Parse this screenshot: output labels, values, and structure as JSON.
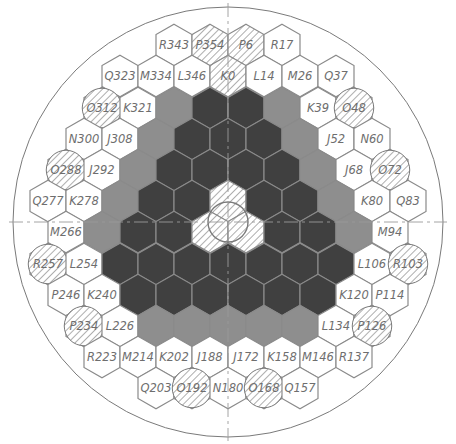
{
  "diagram": {
    "center": [
      228,
      222
    ],
    "outer_circle_radius": 215,
    "central_circle_radius": 20,
    "hex_width": 36,
    "row_spacing": 31.2,
    "colors": {
      "background": "#ffffff",
      "outline": "#8a8a8a",
      "dark": "#404040",
      "gray": "#8e8e8e",
      "light": "#ffffff",
      "hatch": "#9a9a9a",
      "circle_line": "#7a7a7a",
      "label": "#6e6e6e"
    },
    "legend_types": {
      "light": "labeled assembly",
      "hatched": "hatched hexagonal assembly",
      "circle": "hatched circular position",
      "dark": "dark shaded assembly",
      "gray": "gray shaded assembly"
    },
    "cells": [
      {
        "x": 174,
        "y": 45,
        "type": "light",
        "label": "R343"
      },
      {
        "x": 210,
        "y": 45,
        "type": "hatched",
        "label": "P354"
      },
      {
        "x": 246,
        "y": 45,
        "type": "hatched",
        "label": "P6"
      },
      {
        "x": 282,
        "y": 45,
        "type": "light",
        "label": "R17"
      },
      {
        "x": 120,
        "y": 76,
        "type": "light",
        "label": "Q323"
      },
      {
        "x": 156,
        "y": 76,
        "type": "light",
        "label": "M334"
      },
      {
        "x": 192,
        "y": 76,
        "type": "light",
        "label": "L346"
      },
      {
        "x": 228,
        "y": 76,
        "type": "hatched",
        "label": "K0"
      },
      {
        "x": 264,
        "y": 76,
        "type": "light",
        "label": "L14"
      },
      {
        "x": 300,
        "y": 76,
        "type": "light",
        "label": "M26"
      },
      {
        "x": 336,
        "y": 76,
        "type": "light",
        "label": "Q37"
      },
      {
        "x": 102,
        "y": 108,
        "type": "circle",
        "label": "O312"
      },
      {
        "x": 138,
        "y": 108,
        "type": "light",
        "label": "K321"
      },
      {
        "x": 174,
        "y": 108,
        "type": "gray",
        "label": ""
      },
      {
        "x": 210,
        "y": 108,
        "type": "dark",
        "label": ""
      },
      {
        "x": 246,
        "y": 108,
        "type": "dark",
        "label": ""
      },
      {
        "x": 282,
        "y": 108,
        "type": "gray",
        "label": ""
      },
      {
        "x": 318,
        "y": 108,
        "type": "light",
        "label": "K39"
      },
      {
        "x": 354,
        "y": 108,
        "type": "circle",
        "label": "O48"
      },
      {
        "x": 84,
        "y": 139,
        "type": "light",
        "label": "N300"
      },
      {
        "x": 120,
        "y": 139,
        "type": "light",
        "label": "J308"
      },
      {
        "x": 156,
        "y": 139,
        "type": "gray",
        "label": ""
      },
      {
        "x": 192,
        "y": 139,
        "type": "dark",
        "label": ""
      },
      {
        "x": 228,
        "y": 139,
        "type": "dark",
        "label": ""
      },
      {
        "x": 264,
        "y": 139,
        "type": "dark",
        "label": ""
      },
      {
        "x": 300,
        "y": 139,
        "type": "gray",
        "label": ""
      },
      {
        "x": 336,
        "y": 139,
        "type": "light",
        "label": "J52"
      },
      {
        "x": 372,
        "y": 139,
        "type": "light",
        "label": "N60"
      },
      {
        "x": 66,
        "y": 170,
        "type": "circle",
        "label": "O288"
      },
      {
        "x": 102,
        "y": 170,
        "type": "light",
        "label": "J292"
      },
      {
        "x": 138,
        "y": 170,
        "type": "gray",
        "label": ""
      },
      {
        "x": 174,
        "y": 170,
        "type": "dark",
        "label": ""
      },
      {
        "x": 210,
        "y": 170,
        "type": "dark",
        "label": ""
      },
      {
        "x": 246,
        "y": 170,
        "type": "dark",
        "label": ""
      },
      {
        "x": 282,
        "y": 170,
        "type": "dark",
        "label": ""
      },
      {
        "x": 318,
        "y": 170,
        "type": "gray",
        "label": ""
      },
      {
        "x": 354,
        "y": 170,
        "type": "light",
        "label": "J68"
      },
      {
        "x": 390,
        "y": 170,
        "type": "circle",
        "label": "O72"
      },
      {
        "x": 48,
        "y": 201,
        "type": "light",
        "label": "Q277"
      },
      {
        "x": 84,
        "y": 201,
        "type": "light",
        "label": "K278"
      },
      {
        "x": 120,
        "y": 201,
        "type": "gray",
        "label": ""
      },
      {
        "x": 156,
        "y": 201,
        "type": "dark",
        "label": ""
      },
      {
        "x": 192,
        "y": 201,
        "type": "dark",
        "label": ""
      },
      {
        "x": 228,
        "y": 201,
        "type": "hatched",
        "label": ""
      },
      {
        "x": 264,
        "y": 201,
        "type": "dark",
        "label": ""
      },
      {
        "x": 300,
        "y": 201,
        "type": "dark",
        "label": ""
      },
      {
        "x": 336,
        "y": 201,
        "type": "gray",
        "label": ""
      },
      {
        "x": 372,
        "y": 201,
        "type": "light",
        "label": "K80"
      },
      {
        "x": 408,
        "y": 201,
        "type": "light",
        "label": "Q83"
      },
      {
        "x": 66,
        "y": 232,
        "type": "light",
        "label": "M266"
      },
      {
        "x": 102,
        "y": 232,
        "type": "gray",
        "label": ""
      },
      {
        "x": 138,
        "y": 232,
        "type": "dark",
        "label": ""
      },
      {
        "x": 174,
        "y": 232,
        "type": "dark",
        "label": ""
      },
      {
        "x": 210,
        "y": 232,
        "type": "hatched",
        "label": ""
      },
      {
        "x": 246,
        "y": 232,
        "type": "hatched",
        "label": ""
      },
      {
        "x": 282,
        "y": 232,
        "type": "dark",
        "label": ""
      },
      {
        "x": 318,
        "y": 232,
        "type": "dark",
        "label": ""
      },
      {
        "x": 354,
        "y": 232,
        "type": "gray",
        "label": ""
      },
      {
        "x": 390,
        "y": 232,
        "type": "light",
        "label": "M94"
      },
      {
        "x": 48,
        "y": 264,
        "type": "circle",
        "label": "R257"
      },
      {
        "x": 84,
        "y": 264,
        "type": "light",
        "label": "L254"
      },
      {
        "x": 120,
        "y": 264,
        "type": "dark",
        "label": ""
      },
      {
        "x": 156,
        "y": 264,
        "type": "dark",
        "label": ""
      },
      {
        "x": 192,
        "y": 264,
        "type": "dark",
        "label": ""
      },
      {
        "x": 228,
        "y": 264,
        "type": "dark",
        "label": ""
      },
      {
        "x": 264,
        "y": 264,
        "type": "dark",
        "label": ""
      },
      {
        "x": 300,
        "y": 264,
        "type": "dark",
        "label": ""
      },
      {
        "x": 336,
        "y": 264,
        "type": "dark",
        "label": ""
      },
      {
        "x": 372,
        "y": 264,
        "type": "light",
        "label": "L106"
      },
      {
        "x": 408,
        "y": 264,
        "type": "circle",
        "label": "R103"
      },
      {
        "x": 66,
        "y": 295,
        "type": "light",
        "label": "P246"
      },
      {
        "x": 102,
        "y": 295,
        "type": "light",
        "label": "K240"
      },
      {
        "x": 138,
        "y": 295,
        "type": "dark",
        "label": ""
      },
      {
        "x": 174,
        "y": 295,
        "type": "dark",
        "label": ""
      },
      {
        "x": 210,
        "y": 295,
        "type": "dark",
        "label": ""
      },
      {
        "x": 246,
        "y": 295,
        "type": "dark",
        "label": ""
      },
      {
        "x": 282,
        "y": 295,
        "type": "dark",
        "label": ""
      },
      {
        "x": 318,
        "y": 295,
        "type": "dark",
        "label": ""
      },
      {
        "x": 354,
        "y": 295,
        "type": "light",
        "label": "K120"
      },
      {
        "x": 390,
        "y": 295,
        "type": "light",
        "label": "P114"
      },
      {
        "x": 84,
        "y": 326,
        "type": "circle",
        "label": "P234"
      },
      {
        "x": 120,
        "y": 326,
        "type": "light",
        "label": "L226"
      },
      {
        "x": 156,
        "y": 326,
        "type": "gray",
        "label": ""
      },
      {
        "x": 192,
        "y": 326,
        "type": "gray",
        "label": ""
      },
      {
        "x": 228,
        "y": 326,
        "type": "gray",
        "label": ""
      },
      {
        "x": 264,
        "y": 326,
        "type": "gray",
        "label": ""
      },
      {
        "x": 300,
        "y": 326,
        "type": "gray",
        "label": ""
      },
      {
        "x": 336,
        "y": 326,
        "type": "light",
        "label": "L134"
      },
      {
        "x": 372,
        "y": 326,
        "type": "circle",
        "label": "P126"
      },
      {
        "x": 102,
        "y": 357,
        "type": "light",
        "label": "R223"
      },
      {
        "x": 138,
        "y": 357,
        "type": "light",
        "label": "M214"
      },
      {
        "x": 174,
        "y": 357,
        "type": "light",
        "label": "K202"
      },
      {
        "x": 210,
        "y": 357,
        "type": "light",
        "label": "J188"
      },
      {
        "x": 246,
        "y": 357,
        "type": "light",
        "label": "J172"
      },
      {
        "x": 282,
        "y": 357,
        "type": "light",
        "label": "K158"
      },
      {
        "x": 318,
        "y": 357,
        "type": "light",
        "label": "M146"
      },
      {
        "x": 354,
        "y": 357,
        "type": "light",
        "label": "R137"
      },
      {
        "x": 156,
        "y": 388,
        "type": "light",
        "label": "Q203"
      },
      {
        "x": 192,
        "y": 388,
        "type": "circle",
        "label": "O192"
      },
      {
        "x": 228,
        "y": 388,
        "type": "light",
        "label": "N180"
      },
      {
        "x": 264,
        "y": 388,
        "type": "circle",
        "label": "O168"
      },
      {
        "x": 300,
        "y": 388,
        "type": "light",
        "label": "Q157"
      }
    ]
  }
}
